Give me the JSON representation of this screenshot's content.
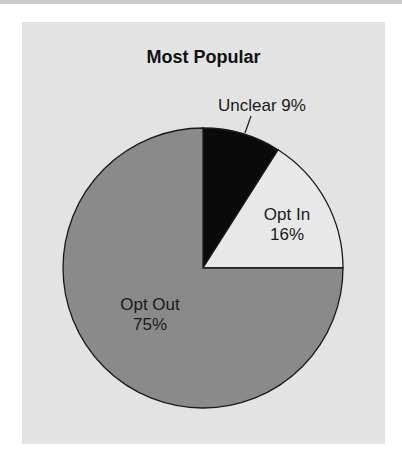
{
  "chart_data": {
    "type": "pie",
    "title": "Most Popular",
    "categories": [
      "Unclear",
      "Opt In",
      "Opt Out"
    ],
    "values": [
      9,
      16,
      75
    ],
    "unit": "%",
    "colors": [
      "#0a0a0a",
      "#e8e8e8",
      "#8a8a8a"
    ],
    "start_angle": "12 o'clock, clockwise",
    "labels": [
      {
        "name": "Unclear",
        "text": "Unclear 9%",
        "leader_line": true
      },
      {
        "name": "Opt In",
        "line1": "Opt In",
        "line2": "16%"
      },
      {
        "name": "Opt Out",
        "line1": "Opt Out",
        "line2": "75%"
      }
    ],
    "legend": "none (direct labels)"
  },
  "colors": {
    "panel_background": "#e3e3e3",
    "page_background": "#ffffff",
    "top_band": "#c9c9c9",
    "outline": "#1a1a1a"
  }
}
